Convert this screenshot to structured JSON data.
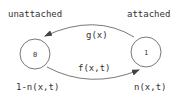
{
  "diagram": {
    "type": "state-transition",
    "states": [
      {
        "id": "0",
        "label": "0",
        "name": "unattached",
        "probability": "1-n(x,t)"
      },
      {
        "id": "1",
        "label": "1",
        "name": "attached",
        "probability": "n(x,t)"
      }
    ],
    "transitions": [
      {
        "from": "1",
        "to": "0",
        "label": "g(x)"
      },
      {
        "from": "0",
        "to": "1",
        "label": "f(x,t)"
      }
    ],
    "colors": {
      "stroke": "#444444",
      "text": "#333333",
      "background": "#ffffff"
    }
  }
}
